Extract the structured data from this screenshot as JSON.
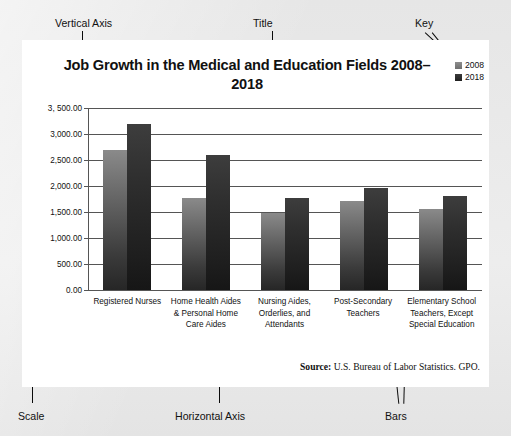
{
  "figure": {
    "source_note_bold": "Source:",
    "source_note_text": " U.S. Bureau of Labor Statistics. GPO."
  },
  "annotations": {
    "vertical_axis": "Vertical Axis",
    "title": "Title",
    "key": "Key",
    "scale": "Scale",
    "horizontal_axis": "Horizontal Axis",
    "bars": "Bars"
  },
  "colors": {
    "series_2008": "#7b7b7b",
    "series_2018": "#272727",
    "panel_background": "#ffffff",
    "page_background": "#e9e9e9",
    "gridline": "#555555"
  },
  "chart_data": {
    "type": "bar",
    "title": "Job Growth in the Medical and Education Fields 2008–2018",
    "xlabel": "",
    "ylabel": "",
    "grid": true,
    "legend_position": "top-right",
    "ylim": [
      0,
      3500
    ],
    "yticks": [
      0,
      500,
      1000,
      1500,
      2000,
      2500,
      3000,
      3500
    ],
    "ytick_labels": [
      "0.00",
      "500.00",
      "1,000.00",
      "1,500.00",
      "2,000.00",
      "2,500.00",
      "3,000.00",
      "3, 500.00"
    ],
    "categories": [
      "Registered Nurses",
      "Home Health Aides & Personal Home Care Aides",
      "Nursing Aides, Orderlies, and Attendants",
      "Post-Secondary Teachers",
      "Elementary School Teachers, Except Special Education"
    ],
    "series": [
      {
        "name": "2008",
        "values": [
          2700,
          1760,
          1480,
          1720,
          1560
        ]
      },
      {
        "name": "2018",
        "values": [
          3200,
          2590,
          1770,
          1960,
          1810
        ]
      }
    ]
  }
}
